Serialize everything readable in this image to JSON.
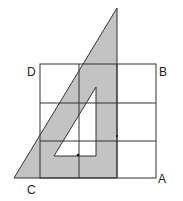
{
  "labels": {
    "A": "A",
    "B": "B",
    "C": "C",
    "D": "D"
  },
  "colors": {
    "triangle_fill": "#c3c3c3",
    "line": "#333333",
    "background": "#ffffff"
  },
  "grid": {
    "columns": 3,
    "rows": 3,
    "x_lines": [
      40,
      79,
      117,
      156
    ],
    "y_lines": [
      64,
      103,
      141,
      178
    ]
  },
  "triangle": {
    "outer": [
      [
        117,
        8
      ],
      [
        14,
        178
      ],
      [
        117,
        178
      ]
    ],
    "inner_cutout": [
      [
        96,
        87
      ],
      [
        54,
        156
      ],
      [
        96,
        156
      ]
    ]
  },
  "dots": [
    [
      78,
      155
    ],
    [
      117,
      136
    ]
  ]
}
